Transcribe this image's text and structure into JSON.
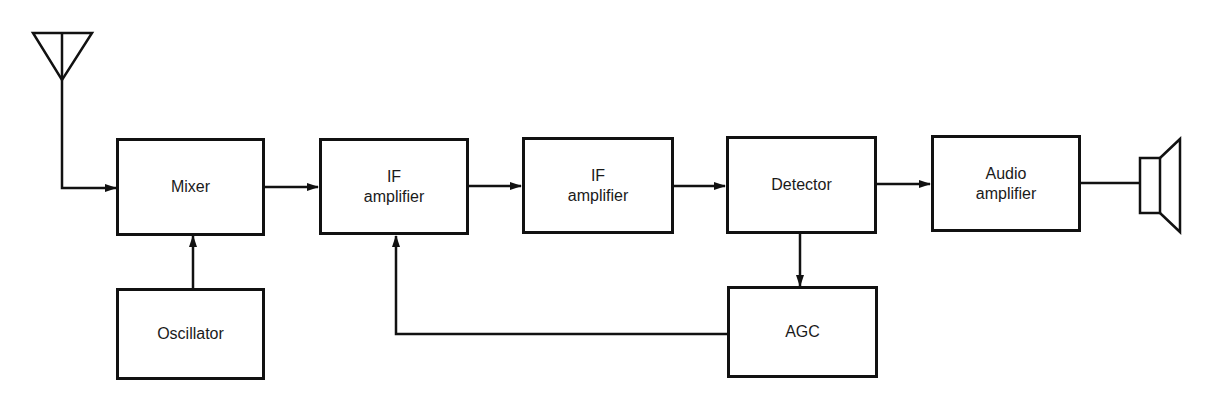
{
  "diagram": {
    "colors": {
      "line": "#111111",
      "background": "#ffffff",
      "text": "#1a1a1a"
    },
    "blocks": {
      "mixer": {
        "line1": "Mixer",
        "line2": ""
      },
      "if_amp_1": {
        "line1": "IF",
        "line2": "amplifier"
      },
      "if_amp_2": {
        "line1": "IF",
        "line2": "amplifier"
      },
      "detector": {
        "line1": "Detector",
        "line2": ""
      },
      "audio_amp": {
        "line1": "Audio",
        "line2": "amplifier"
      },
      "oscillator": {
        "line1": "Oscillator",
        "line2": ""
      },
      "agc": {
        "line1": "AGC",
        "line2": ""
      }
    },
    "icons": {
      "antenna": "antenna-icon",
      "speaker": "speaker-icon"
    },
    "connections": [
      "antenna -> mixer",
      "oscillator -> mixer",
      "mixer -> if_amp_1",
      "if_amp_1 -> if_amp_2",
      "if_amp_2 -> detector",
      "detector -> audio_amp",
      "audio_amp -> speaker",
      "detector -> agc",
      "agc -> if_amp_1"
    ]
  }
}
